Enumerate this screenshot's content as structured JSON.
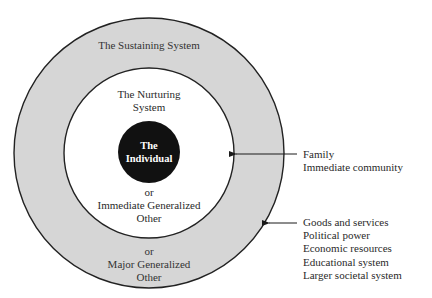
{
  "diagram": {
    "outer_ring": {
      "title": "The Sustaining System",
      "or_label": "or",
      "alt_name_line1": "Major Generalized",
      "alt_name_line2": "Other",
      "fill": "#d6d6d6"
    },
    "inner_ring": {
      "title_line1": "The Nurturing",
      "title_line2": "System",
      "or_label": "or",
      "alt_name_line1": "Immediate Generalized",
      "alt_name_line2": "Other",
      "fill": "#ffffff"
    },
    "core": {
      "line1": "The",
      "line2": "Individual",
      "fill": "#111111"
    },
    "callouts": [
      {
        "target": "inner_ring",
        "items": [
          "Family",
          "Immediate community"
        ]
      },
      {
        "target": "outer_ring",
        "items": [
          "Goods and services",
          "Political power",
          "Economic resources",
          "Educational system",
          "Larger societal system"
        ]
      }
    ]
  }
}
